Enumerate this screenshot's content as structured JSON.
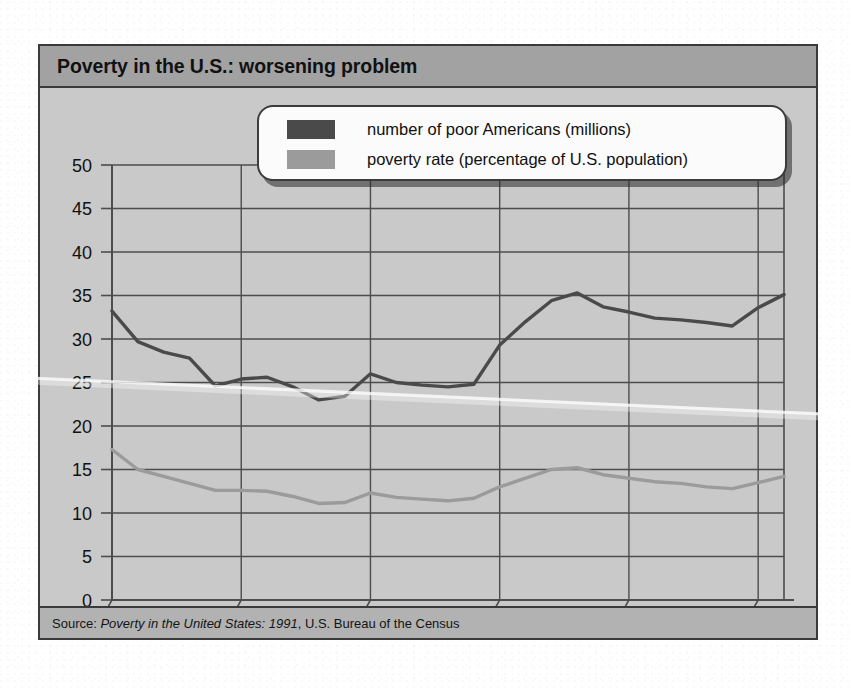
{
  "figure": {
    "title": "Poverty in the U.S.: worsening problem",
    "source_prefix": "Source: ",
    "source_italic": "Poverty in the United States: 1991",
    "source_suffix": ", U.S. Bureau of the Census"
  },
  "legend": {
    "items": [
      {
        "label": "number of poor Americans (millions)",
        "color": "#4a4a4a"
      },
      {
        "label": "poverty rate (percentage of U.S. population)",
        "color": "#9b9b9b"
      }
    ]
  },
  "colors": {
    "panel_background": "#c9c9c9",
    "title_bar": "#a2a2a2",
    "source_bar": "#b2b2b2",
    "frame": "#3a3a3a",
    "grid": "#4d4d4d",
    "series_dark": "#4a4a4a",
    "series_light": "#9b9b9b",
    "legend_background": "#fbfbfb"
  },
  "chart_data": {
    "type": "line",
    "title": "Poverty in the U.S.: worsening problem",
    "xlabel": "",
    "ylabel": "",
    "xlim": [
      1965,
      1991
    ],
    "ylim": [
      0,
      50
    ],
    "ytick_values": [
      0,
      5,
      10,
      15,
      20,
      25,
      30,
      35,
      40,
      45,
      50
    ],
    "ytick_labels": [
      "0",
      "5",
      "10",
      "15",
      "20",
      "25",
      "30",
      "35",
      "40",
      "45",
      "50"
    ],
    "xtick_values": [
      1965,
      1970,
      1975,
      1980,
      1985,
      1990
    ],
    "xtick_labels": [
      "1965",
      "1970",
      "1975",
      "1980",
      "1985",
      "1990"
    ],
    "xtick_rotation": -38,
    "grid": true,
    "legend_position": "top-center",
    "x": [
      1965,
      1966,
      1967,
      1968,
      1969,
      1970,
      1971,
      1972,
      1973,
      1974,
      1975,
      1976,
      1977,
      1978,
      1979,
      1980,
      1981,
      1982,
      1983,
      1984,
      1985,
      1986,
      1987,
      1988,
      1989,
      1990,
      1991
    ],
    "series": [
      {
        "name": "number of poor Americans (millions)",
        "color": "#4a4a4a",
        "unit": "millions",
        "values": [
          33.2,
          29.7,
          28.5,
          27.8,
          24.6,
          25.4,
          25.6,
          24.5,
          23.0,
          23.4,
          26.0,
          25.0,
          24.7,
          24.5,
          24.8,
          29.3,
          32.0,
          34.4,
          35.3,
          33.7,
          33.1,
          32.4,
          32.2,
          31.9,
          31.5,
          33.6,
          35.1
        ]
      },
      {
        "name": "poverty rate (percentage of U.S. population)",
        "color": "#9b9b9b",
        "unit": "percent",
        "values": [
          17.3,
          15.0,
          14.2,
          13.4,
          12.6,
          12.6,
          12.5,
          11.9,
          11.1,
          11.2,
          12.3,
          11.8,
          11.6,
          11.4,
          11.7,
          13.0,
          14.0,
          15.0,
          15.2,
          14.4,
          14.0,
          13.6,
          13.4,
          13.0,
          12.8,
          13.5,
          14.2
        ]
      }
    ]
  }
}
